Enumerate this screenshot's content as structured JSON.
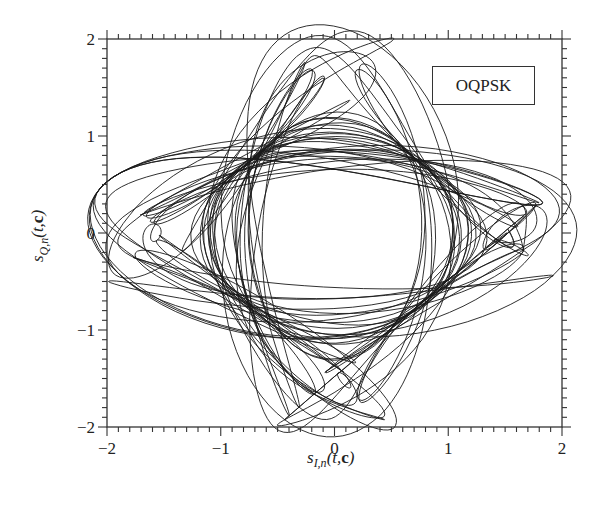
{
  "chart_data": {
    "type": "scatter",
    "subtype": "signal-trajectory (I/Q phase-plane line plot)",
    "title": "",
    "legend": [
      "OQPSK"
    ],
    "legend_position": "upper-right (inside plot)",
    "xlabel": "s_{I,n}(t,c)",
    "ylabel": "s_{Q,n}(t,c)",
    "xlim": [
      -2,
      2
    ],
    "ylim": [
      -2,
      2
    ],
    "xticks": [
      -2,
      -1,
      0,
      1,
      2
    ],
    "yticks": [
      -2,
      -1,
      0,
      1,
      2
    ],
    "minor_ticks_per_major": 10,
    "grid": false,
    "series": [
      {
        "name": "OQPSK",
        "color": "#1a1a1a",
        "description": "Dense overlapping trajectory tracing a diamond-shaped envelope with a roughly circular hole in the middle; constellation points clustered near (±1,0) and (0,±1) with excursions out to about ±1.45.",
        "extent": {
          "x": [
            -1.45,
            1.45
          ],
          "y": [
            -1.45,
            1.48
          ]
        },
        "inner_hole_radius": 0.7,
        "cluster_points": [
          [
            1.15,
            0
          ],
          [
            -1.15,
            0
          ],
          [
            0,
            1.1
          ],
          [
            0,
            -1.1
          ]
        ]
      }
    ],
    "simulation": {
      "symbols": 150,
      "samples_per_symbol": 24,
      "seed": 7,
      "pulse_rolloff": 0.35,
      "pulse_span": 4,
      "gain": 1.0
    }
  },
  "legend": {
    "label": "OQPSK"
  },
  "axes": {
    "x_tick_labels": [
      "−2",
      "−1",
      "0",
      "1",
      "2"
    ],
    "y_tick_labels": [
      "2",
      "1",
      "0",
      "−1",
      "−2"
    ],
    "xlabel_main": "s",
    "xlabel_sub": "I,n",
    "xlabel_args_open": "(t,",
    "xlabel_bold": "c",
    "xlabel_args_close": ")",
    "ylabel_main": "s",
    "ylabel_sub": "Q,n",
    "ylabel_args_open": "(t,",
    "ylabel_bold": "c",
    "ylabel_args_close": ")"
  },
  "plot_area": {
    "left": 107,
    "top": 39,
    "right": 562,
    "bottom": 427
  },
  "colors": {
    "line": "#1a1a1a",
    "axis": "#333333",
    "background": "#ffffff"
  }
}
